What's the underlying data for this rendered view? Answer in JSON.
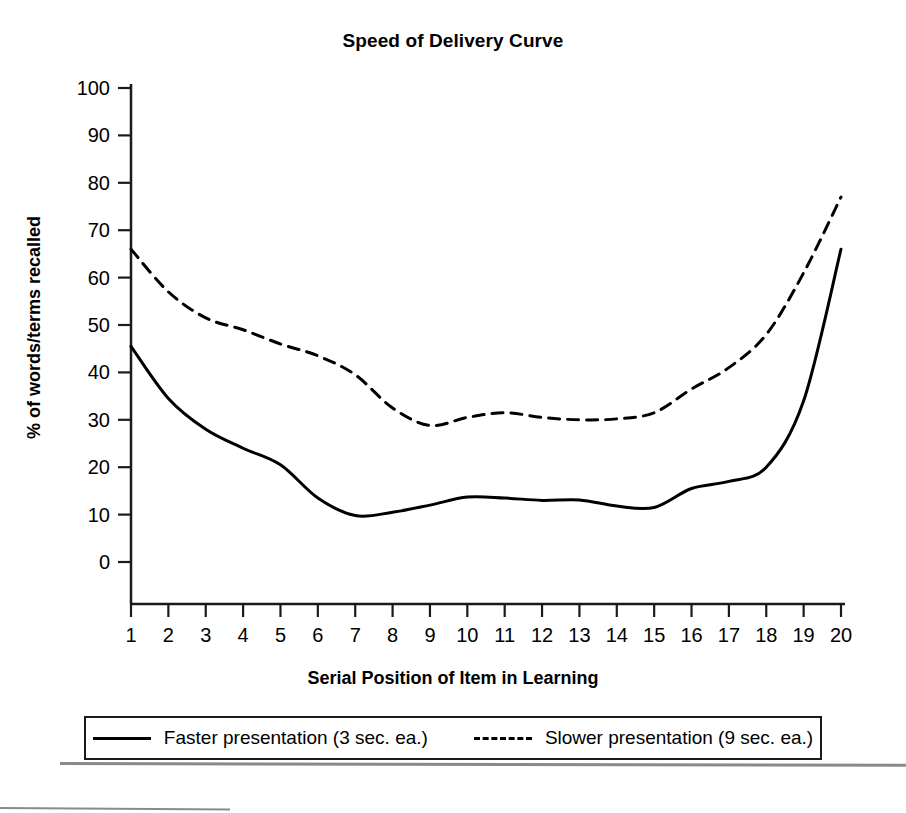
{
  "chart_data": {
    "type": "line",
    "title": "Speed of Delivery Curve",
    "xlabel": "Serial Position of Item in Learning",
    "ylabel": "% of words/terms recalled",
    "xlim": [
      1,
      20
    ],
    "ylim": [
      0,
      100
    ],
    "xticks": [
      "1",
      "2",
      "3",
      "4",
      "5",
      "6",
      "7",
      "8",
      "9",
      "10",
      "11",
      "12",
      "13",
      "14",
      "15",
      "16",
      "17",
      "18",
      "19",
      "20"
    ],
    "yticks": [
      "0",
      "10",
      "20",
      "30",
      "40",
      "50",
      "60",
      "70",
      "80",
      "90",
      "100"
    ],
    "grid": false,
    "legend_position": "bottom",
    "x": [
      1,
      2,
      3,
      4,
      5,
      6,
      7,
      8,
      9,
      10,
      11,
      12,
      13,
      14,
      15,
      16,
      17,
      18,
      19,
      20
    ],
    "series": [
      {
        "name": "Faster presentation (3 sec. ea.)",
        "style": "solid",
        "color": "#000000",
        "values": [
          45.5,
          34.5,
          28.0,
          24.0,
          20.5,
          13.5,
          9.8,
          10.5,
          12.0,
          13.7,
          13.5,
          13.0,
          13.1,
          11.8,
          11.5,
          15.5,
          17.0,
          20.0,
          34.0,
          66.0
        ]
      },
      {
        "name": "Slower presentation (9 sec. ea.)",
        "style": "dashed",
        "color": "#000000",
        "values": [
          66.0,
          57.0,
          51.5,
          49.0,
          46.0,
          43.5,
          39.5,
          32.5,
          28.8,
          30.5,
          31.5,
          30.5,
          30.0,
          30.2,
          31.5,
          36.5,
          41.0,
          48.0,
          61.0,
          77.0
        ]
      }
    ]
  },
  "legend": {
    "entries": [
      {
        "label": "Faster presentation (3 sec. ea.)",
        "style": "solid"
      },
      {
        "label": "Slower presentation (9 sec. ea.)",
        "style": "dashed"
      }
    ]
  }
}
